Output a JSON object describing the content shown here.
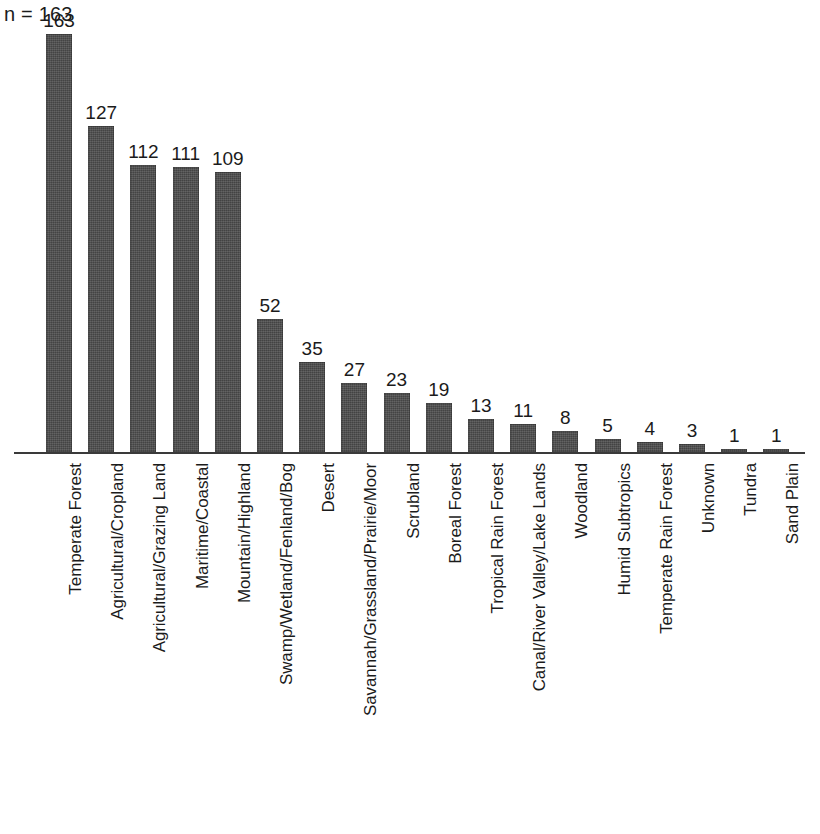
{
  "annotation": {
    "sample_size_label": "n = 163"
  },
  "colors": {
    "bar_fill": "#4d4d4d",
    "axis": "#3a3a3a",
    "text": "#1b1b1b",
    "background": "#ffffff"
  },
  "chart_data": {
    "type": "bar",
    "title": "",
    "subtitle": "",
    "xlabel": "",
    "ylabel": "",
    "grid": false,
    "legend": "none",
    "orientation": "vertical",
    "axis_ticks_visible": false,
    "ylim": [
      0,
      163
    ],
    "annotations": [
      "n = 163"
    ],
    "categories": [
      "Temperate Forest",
      "Agricultural/Cropland",
      "Agricultural/Grazing Land",
      "Maritime/Coastal",
      "Mountain/Highland",
      "Swamp/Wetland/Fenland/Bog",
      "Desert",
      "Savannah/Grassland/Prairie/Moor",
      "Scrubland",
      "Boreal Forest",
      "Tropical Rain Forest",
      "Canal/River Valley/Lake Lands",
      "Woodland",
      "Humid Subtropics",
      "Temperate Rain Forest",
      "Unknown",
      "Tundra",
      "Sand Plain"
    ],
    "values": [
      163,
      127,
      112,
      111,
      109,
      52,
      35,
      27,
      23,
      19,
      13,
      11,
      8,
      5,
      4,
      3,
      1,
      1
    ],
    "value_labels": [
      "163",
      "127",
      "112",
      "111",
      "109",
      "52",
      "35",
      "27",
      "23",
      "19",
      "13",
      "11",
      "8",
      "5",
      "4",
      "3",
      "1",
      "1"
    ]
  }
}
